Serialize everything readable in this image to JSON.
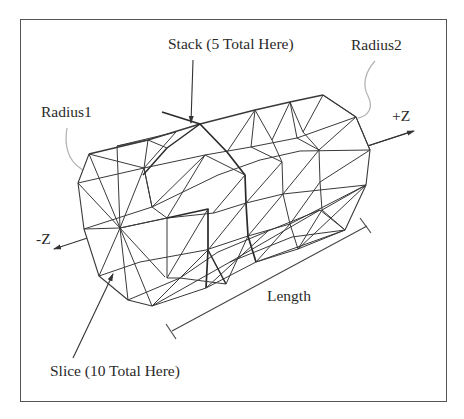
{
  "diagram": {
    "labels": {
      "stack": "Stack (5 Total Here)",
      "radius1": "Radius1",
      "radius2": "Radius2",
      "plus_z": "+Z",
      "minus_z": "-Z",
      "length": "Length",
      "slice": "Slice (10 Total Here)"
    },
    "mesh": {
      "stacks": 5,
      "slices": 10
    },
    "colors": {
      "line": "#333333",
      "heavy_line": "#222222",
      "leader_curve": "#b0b0b0",
      "frame": "#555555",
      "text": "#2a2a2a",
      "background": "#ffffff"
    }
  }
}
